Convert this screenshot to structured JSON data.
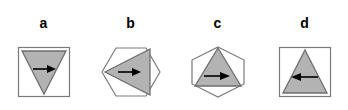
{
  "figure": {
    "type": "diagram",
    "background_color": "#ffffff",
    "outline_color": "#7a7a7a",
    "triangle_fill": "#b3b3b3",
    "triangle_stroke": "#6e6e6e",
    "arrow_color": "#000000",
    "label_color": "#000000",
    "panels": [
      {
        "id": "a",
        "label": "a",
        "outer_shape": "square",
        "inner_shape": "triangle",
        "triangle_orientation": "down",
        "arrow_direction": "right",
        "arrow_glyph": "→"
      },
      {
        "id": "b",
        "label": "b",
        "outer_shape": "hexagon",
        "inner_shape": "triangle",
        "triangle_orientation": "left",
        "arrow_direction": "right",
        "arrow_glyph": "→"
      },
      {
        "id": "c",
        "label": "c",
        "outer_shape": "hexagon",
        "inner_shape": "triangle",
        "triangle_orientation": "up",
        "arrow_direction": "right",
        "arrow_glyph": "→"
      },
      {
        "id": "d",
        "label": "d",
        "outer_shape": "square",
        "inner_shape": "triangle",
        "triangle_orientation": "up",
        "arrow_direction": "left",
        "arrow_glyph": "←"
      }
    ]
  }
}
